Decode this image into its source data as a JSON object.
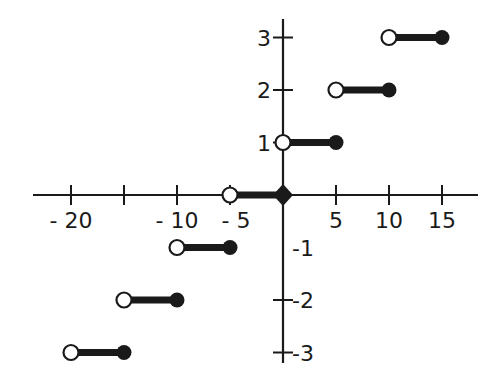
{
  "chart_data": {
    "type": "line",
    "subtype": "step-function",
    "title": "",
    "xlabel": "",
    "ylabel": "",
    "xlim": [
      -23,
      18
    ],
    "ylim": [
      -3.3,
      3.3
    ],
    "grid": false,
    "legend": null,
    "x_ticks": [
      -20,
      -15,
      -10,
      -5,
      5,
      10,
      15
    ],
    "x_tick_labels": [
      "-20",
      "-10",
      "-5",
      "5",
      "10",
      "15"
    ],
    "y_ticks": [
      3,
      2,
      1,
      -2,
      -3
    ],
    "y_tick_labels": [
      "3",
      "2",
      "1",
      "-1",
      "-2",
      "-3"
    ],
    "segments": [
      {
        "y": 3,
        "x_start": 10,
        "x_end": 15,
        "start_open": true,
        "end_closed": true
      },
      {
        "y": 2,
        "x_start": 5,
        "x_end": 10,
        "start_open": true,
        "end_closed": true
      },
      {
        "y": 1,
        "x_start": 0,
        "x_end": 5,
        "start_open": true,
        "end_closed": true
      },
      {
        "y": 0,
        "x_start": -5,
        "x_end": 0,
        "start_open": true,
        "end_closed": true
      },
      {
        "y": -1,
        "x_start": -10,
        "x_end": -5,
        "start_open": true,
        "end_closed": true
      },
      {
        "y": -2,
        "x_start": -15,
        "x_end": -10,
        "start_open": true,
        "end_closed": true
      },
      {
        "y": -3,
        "x_start": -20,
        "x_end": -15,
        "start_open": true,
        "end_closed": true
      }
    ],
    "colors": {
      "ink": "#1a1a1a",
      "background": "#ffffff"
    }
  },
  "layout": {
    "origin_px": [
      283,
      195
    ],
    "px_per_x_unit": 10.6,
    "px_per_y_unit": 52.5,
    "x_axis_px": [
      33,
      478
    ],
    "y_axis_px": [
      19,
      363
    ]
  }
}
